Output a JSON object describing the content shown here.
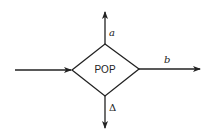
{
  "diagram": {
    "node": {
      "label": "POP",
      "shape": "diamond"
    },
    "edges": [
      {
        "id": "input",
        "direction": "in-from-left",
        "label": ""
      },
      {
        "id": "a",
        "direction": "out-top",
        "label": "a"
      },
      {
        "id": "b",
        "direction": "out-right",
        "label": "b"
      },
      {
        "id": "delta",
        "direction": "out-bottom",
        "label": "Δ"
      }
    ],
    "colors": {
      "stroke": "#222222",
      "background": "#ffffff"
    }
  }
}
